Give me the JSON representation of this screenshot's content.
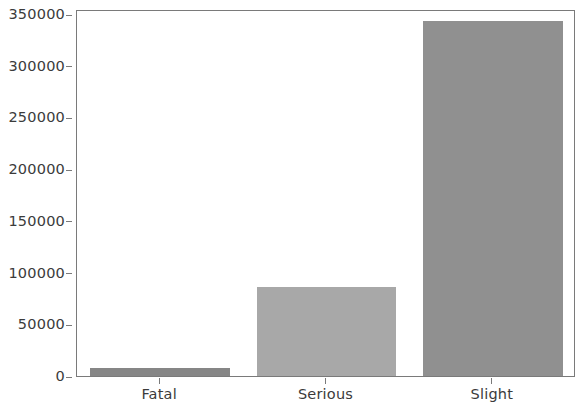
{
  "chart_data": {
    "type": "bar",
    "title": "",
    "subtitle": "",
    "xlabel": "",
    "ylabel": "",
    "categories": [
      "Fatal",
      "Serious",
      "Slight"
    ],
    "values": [
      7700,
      86000,
      343000
    ],
    "series": [
      {
        "name": "Accident count by severity",
        "values": [
          7700,
          86000,
          343000
        ]
      }
    ],
    "bar_colors": [
      "#868686",
      "#a8a8a8",
      "#909090"
    ],
    "ylim": [
      0,
      350000
    ],
    "yticks": [
      0,
      50000,
      100000,
      150000,
      200000,
      250000,
      300000,
      350000
    ],
    "ytick_labels": [
      "0",
      "50000",
      "100000",
      "150000",
      "200000",
      "250000",
      "300000",
      "350000"
    ],
    "xtick_labels": [
      "Fatal",
      "Serious",
      "Slight"
    ],
    "grid": false,
    "legend": null,
    "legend_position": "none",
    "annotations": [],
    "axis_color": "#7a7a7a",
    "tick_label_color": "#3b3b3b",
    "background_color": "#ffffff"
  }
}
